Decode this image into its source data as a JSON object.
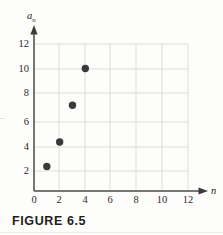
{
  "figure": {
    "caption": "FIGURE 6.5",
    "background_color": "#fdfdfc",
    "ink_color": "#2b2b2b",
    "grid_color": "#d8d8d8",
    "point_color": "#3a3a3a"
  },
  "chart_data": {
    "type": "scatter",
    "title": "",
    "xlabel": "n",
    "ylabel": "a_n",
    "ylabel_display": "a",
    "ylabel_subscript": "n",
    "x": [
      1,
      2,
      3,
      4
    ],
    "values": [
      2,
      4,
      7,
      10
    ],
    "points": [
      {
        "x": 1,
        "y": 2
      },
      {
        "x": 2,
        "y": 4
      },
      {
        "x": 3,
        "y": 7
      },
      {
        "x": 4,
        "y": 10
      }
    ],
    "xlim": [
      0,
      12
    ],
    "ylim": [
      0,
      12
    ],
    "xticks": [
      0,
      2,
      4,
      6,
      8,
      10,
      12
    ],
    "yticks": [
      2,
      4,
      6,
      8,
      10,
      12
    ],
    "xtick_labels": [
      "0",
      "2",
      "4",
      "6",
      "8",
      "10",
      "12"
    ],
    "ytick_labels": [
      "2",
      "4",
      "6",
      "8",
      "10",
      "12"
    ],
    "grid": true,
    "legend": null,
    "axis_arrows": true
  }
}
